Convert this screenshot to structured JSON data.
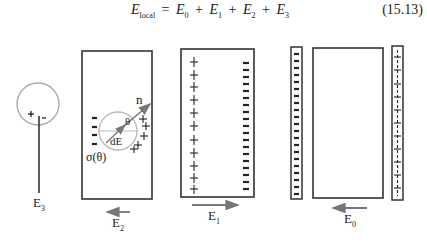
{
  "equation": {
    "lhs": "E",
    "lhs_sub": "local",
    "equals": "=",
    "terms": [
      {
        "base": "E",
        "sub": "0"
      },
      {
        "base": "E",
        "sub": "1"
      },
      {
        "base": "E",
        "sub": "2"
      },
      {
        "base": "E",
        "sub": "3"
      }
    ],
    "plus": "+",
    "number": "(15.13)"
  },
  "panels": {
    "e3": {
      "label": "E",
      "sub": "3",
      "plus": "+",
      "minus": "-"
    },
    "e2": {
      "label": "E",
      "sub": "2",
      "normal": "n",
      "angle": "θ",
      "field": "dE",
      "charge_density": "σ(θ)"
    },
    "e1": {
      "label": "E",
      "sub": "1"
    },
    "e0": {
      "label": "E",
      "sub": "0"
    }
  },
  "colors": {
    "stroke": "#333333",
    "arrow": "#777777",
    "circle": "#aaaaaa"
  }
}
